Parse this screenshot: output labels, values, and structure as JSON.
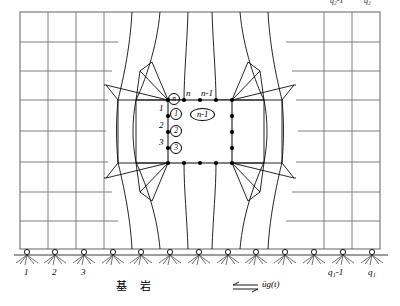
{
  "figure": {
    "type": "finite-element-mesh-diagram"
  },
  "labels": {
    "top_clipped": [
      {
        "text": "q₂-1",
        "x": 332,
        "y": 0
      },
      {
        "text": "q₂",
        "x": 364,
        "y": 0
      }
    ],
    "interior_row_numbers": [
      {
        "text": "1",
        "x": 164,
        "y": 106
      },
      {
        "text": "2",
        "x": 164,
        "y": 123
      },
      {
        "text": "3",
        "x": 164,
        "y": 141
      }
    ],
    "interior_circled": [
      {
        "text": "1",
        "x": 173,
        "y": 104
      },
      {
        "text": "2",
        "x": 173,
        "y": 122
      },
      {
        "text": "3",
        "x": 173,
        "y": 140
      }
    ],
    "circled_n": {
      "text": "n",
      "x": 173,
      "y": 91
    },
    "node_n": {
      "text": "n",
      "x": 188,
      "y": 92
    },
    "node_n_minus_1": {
      "text": "n-1",
      "x": 200,
      "y": 92
    },
    "element_n_minus_1": {
      "text": "n-1",
      "x": 192,
      "y": 106
    },
    "bottom_left_numbers": [
      {
        "text": "1",
        "x": 24,
        "y": 268
      },
      {
        "text": "2",
        "x": 52,
        "y": 268
      },
      {
        "text": "3",
        "x": 82,
        "y": 268
      }
    ],
    "bottom_right_numbers": [
      {
        "text": "q₁-1",
        "x": 330,
        "y": 268
      },
      {
        "text": "q₁",
        "x": 370,
        "y": 268
      }
    ],
    "bedrock": {
      "text": "基 岩",
      "x": 118,
      "y": 283
    },
    "ground_motion": {
      "text": "üg(t)",
      "x": 262,
      "y": 283
    }
  },
  "colors": {
    "line": "#000000",
    "grid_gray": "#6f6f6f",
    "node_fill": "#000000",
    "background": "#ffffff",
    "support_hatch": "#3a3a3a"
  },
  "mesh": {
    "outer_left": 20,
    "outer_right": 380,
    "outer_top": 12,
    "outer_bottom": 249,
    "box_left": 168,
    "box_right": 232,
    "box_top": 100,
    "box_bottom": 163,
    "support_count": 13,
    "horizontal_grid_rows": 8,
    "vertical_grid_cols": 13
  }
}
